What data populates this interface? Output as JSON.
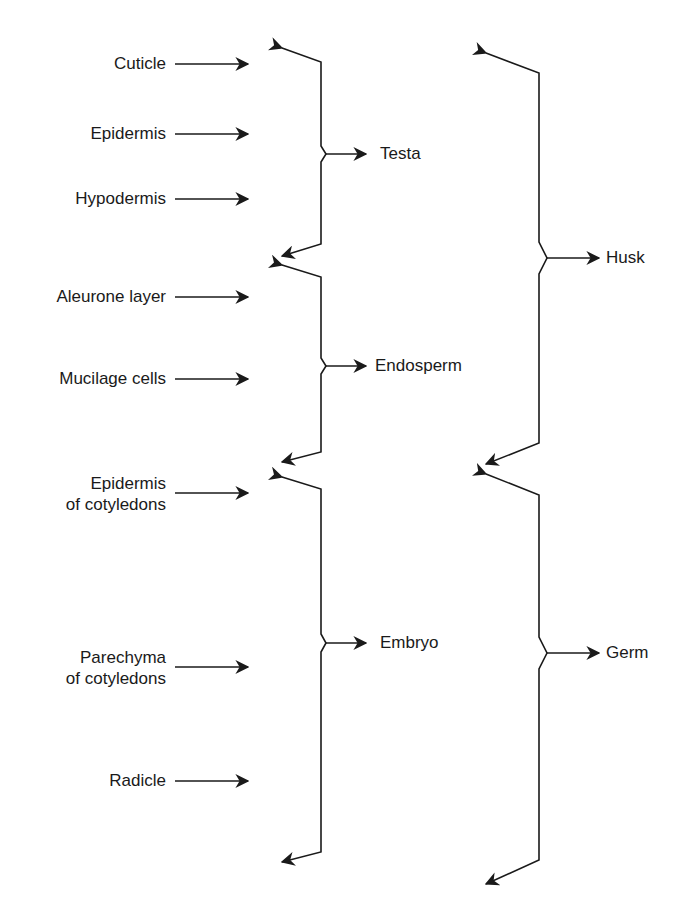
{
  "tissues": [
    {
      "id": "cuticle",
      "label": "Cuticle",
      "lines": [
        "Cuticle"
      ],
      "group": "Testa"
    },
    {
      "id": "epidermis",
      "label": "Epidermis",
      "lines": [
        "Epidermis"
      ],
      "group": "Testa"
    },
    {
      "id": "hypodermis",
      "label": "Hypodermis",
      "lines": [
        "Hypodermis"
      ],
      "group": "Testa"
    },
    {
      "id": "aleurone",
      "label": "Aleurone layer",
      "lines": [
        "Aleurone layer"
      ],
      "group": "Endosperm"
    },
    {
      "id": "mucilage",
      "label": "Mucilage cells",
      "lines": [
        "Mucilage cells"
      ],
      "group": "Endosperm"
    },
    {
      "id": "epidermis-cotyledons",
      "label": "Epidermis of cotyledons",
      "lines": [
        "Epidermis",
        "of cotyledons"
      ],
      "group": "Embryo"
    },
    {
      "id": "parechyma-cotyledons",
      "label": "Parechyma of cotyledons",
      "lines": [
        "Parechyma",
        "of cotyledons"
      ],
      "group": "Embryo"
    },
    {
      "id": "radicle",
      "label": "Radicle",
      "lines": [
        "Radicle"
      ],
      "group": "Embryo"
    }
  ],
  "groups": [
    {
      "id": "testa",
      "label": "Testa",
      "parent": "Husk"
    },
    {
      "id": "endosperm",
      "label": "Endosperm",
      "parent": "Husk"
    },
    {
      "id": "embryo",
      "label": "Embryo",
      "parent": "Germ"
    }
  ],
  "parents": [
    {
      "id": "husk",
      "label": "Husk",
      "children": [
        "Testa",
        "Endosperm"
      ]
    },
    {
      "id": "germ",
      "label": "Germ",
      "children": [
        "Embryo"
      ]
    }
  ],
  "colors": {
    "line": "#1a1a1a",
    "background": "#ffffff"
  }
}
